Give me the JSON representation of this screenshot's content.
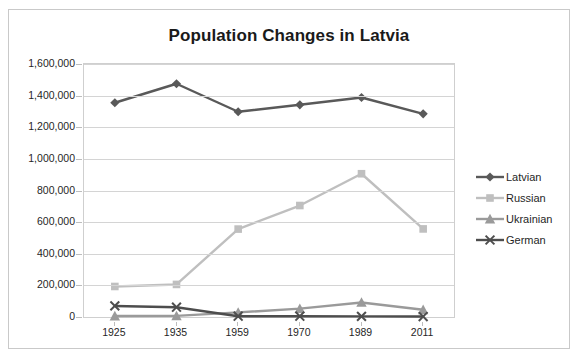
{
  "chart_data": {
    "type": "line",
    "title": "Population Changes in Latvia",
    "xlabel": "",
    "ylabel": "",
    "categories": [
      "1925",
      "1935",
      "1959",
      "1970",
      "1989",
      "2011"
    ],
    "ylim": [
      0,
      1600000
    ],
    "ytick_step": 200000,
    "ytick_labels": [
      "0",
      "200,000",
      "400,000",
      "600,000",
      "800,000",
      "1,000,000",
      "1,200,000",
      "1,400,000",
      "1,600,000"
    ],
    "ytick_values": [
      0,
      200000,
      400000,
      600000,
      800000,
      1000000,
      1200000,
      1400000,
      1600000
    ],
    "grid": true,
    "legend_position": "right",
    "series": [
      {
        "name": "Latvian",
        "color": "#595959",
        "marker": "diamond",
        "values": [
          1355000,
          1475000,
          1298000,
          1342000,
          1388000,
          1285000
        ]
      },
      {
        "name": "Russian",
        "color": "#bfbfbf",
        "marker": "square",
        "values": [
          193000,
          206000,
          556000,
          705000,
          906000,
          557000
        ]
      },
      {
        "name": "Ukrainian",
        "color": "#9a9a9a",
        "marker": "triangle",
        "values": [
          6000,
          7000,
          29000,
          53000,
          92000,
          46000
        ]
      },
      {
        "name": "German",
        "color": "#4d4d4d",
        "marker": "cross",
        "values": [
          70000,
          62000,
          5000,
          5000,
          4000,
          3000
        ]
      }
    ]
  },
  "legend": {
    "items": [
      {
        "label": "Latvian"
      },
      {
        "label": "Russian"
      },
      {
        "label": "Ukrainian"
      },
      {
        "label": "German"
      }
    ]
  }
}
